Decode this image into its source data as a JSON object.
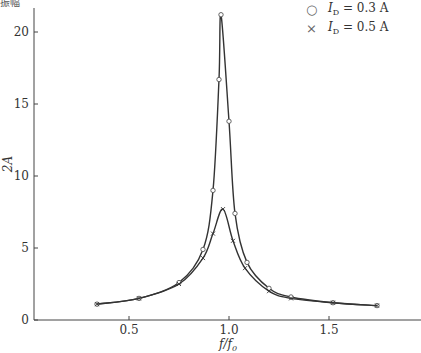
{
  "chart_data": {
    "type": "line",
    "title": "",
    "xlabel": "f/f0",
    "ylabel": "2A",
    "xlim": [
      0.0,
      1.85
    ],
    "ylim": [
      0,
      22
    ],
    "xticks": [
      0.5,
      1.0,
      1.5
    ],
    "xtick_labels": [
      "0.5",
      "1.0",
      "1.5"
    ],
    "yticks": [
      0,
      5,
      10,
      15,
      20
    ],
    "ytick_labels": [
      "0",
      "5",
      "10",
      "15",
      "20"
    ],
    "grid": false,
    "legend_position": "upper right",
    "series": [
      {
        "name": "I_D = 0.3 A",
        "marker": "circle",
        "x": [
          0.34,
          0.55,
          0.75,
          0.87,
          0.92,
          0.95,
          0.96,
          1.0,
          1.03,
          1.09,
          1.2,
          1.31,
          1.52,
          1.74
        ],
        "y": [
          1.1,
          1.5,
          2.6,
          4.9,
          9.0,
          16.7,
          21.2,
          13.8,
          7.4,
          4.0,
          2.2,
          1.6,
          1.2,
          1.0
        ]
      },
      {
        "name": "I_D = 0.5 A",
        "marker": "cross",
        "x": [
          0.34,
          0.55,
          0.75,
          0.87,
          0.92,
          0.97,
          1.02,
          1.08,
          1.2,
          1.31,
          1.52,
          1.74
        ],
        "y": [
          1.1,
          1.5,
          2.5,
          4.3,
          6.0,
          7.7,
          5.5,
          3.6,
          2.0,
          1.5,
          1.2,
          1.0
        ]
      }
    ]
  },
  "legend": {
    "items": [
      {
        "symbol": "○",
        "label_var": "I",
        "label_sub": "D",
        "label_rest": " = 0.3 A"
      },
      {
        "symbol": "×",
        "label_var": "I",
        "label_sub": "D",
        "label_rest": " = 0.5 A"
      }
    ]
  },
  "axes": {
    "xlabel_main": "f",
    "xlabel_sep": "/",
    "xlabel_sub_base": "f",
    "xlabel_sub": "0",
    "ylabel": "2A"
  },
  "corner_text": "振幅"
}
